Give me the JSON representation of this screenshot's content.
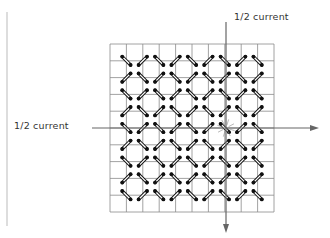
{
  "labels": {
    "vertical_wire": "1/2 current",
    "horizontal_wire": "1/2 current"
  },
  "grid": {
    "rows": 10,
    "cols": 10,
    "x0": 110,
    "y0": 44,
    "x1": 274,
    "y1": 212
  },
  "selected_core": {
    "row": 5,
    "col": 7
  },
  "colors": {
    "grid_line": "#8a8a8a",
    "core": "#111111",
    "wire": "#666666",
    "text": "#333333"
  }
}
